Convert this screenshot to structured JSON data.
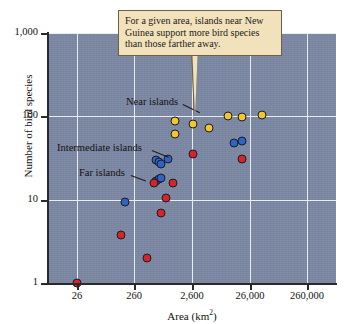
{
  "chart_data": {
    "type": "scatter",
    "title": "",
    "xlabel": "Area (km2)",
    "xlabel_base": "Area (km",
    "xlabel_sup": "2",
    "xlabel_close": ")",
    "ylabel": "Number of bird species",
    "xscale": "log",
    "yscale": "log",
    "xlim": [
      8.2,
      822000
    ],
    "ylim": [
      1,
      1000
    ],
    "grid": true,
    "legend_position": "inline-annotations",
    "xticks": [
      "26",
      "260",
      "2,600",
      "26,000",
      "260,000"
    ],
    "xtick_values": [
      26,
      260,
      2600,
      26000,
      260000
    ],
    "yticks": [
      "1",
      "10",
      "100",
      "1,000"
    ],
    "ytick_values": [
      1,
      10,
      100,
      1000
    ],
    "series": [
      {
        "name": "Near islands",
        "color": "#f2c72e",
        "points": [
          {
            "x": 1300,
            "y": 88
          },
          {
            "x": 1300,
            "y": 62
          },
          {
            "x": 2700,
            "y": 82
          },
          {
            "x": 5200,
            "y": 72
          },
          {
            "x": 11000,
            "y": 102
          },
          {
            "x": 19000,
            "y": 97
          },
          {
            "x": 42000,
            "y": 105
          }
        ]
      },
      {
        "name": "Intermediate islands",
        "color": "#2f63c4",
        "points": [
          {
            "x": 180,
            "y": 9.3
          },
          {
            "x": 620,
            "y": 30
          },
          {
            "x": 700,
            "y": 28
          },
          {
            "x": 760,
            "y": 27
          },
          {
            "x": 1000,
            "y": 31
          },
          {
            "x": 620,
            "y": 17
          },
          {
            "x": 700,
            "y": 17.5
          },
          {
            "x": 760,
            "y": 18
          },
          {
            "x": 14000,
            "y": 48
          },
          {
            "x": 19000,
            "y": 50
          }
        ]
      },
      {
        "name": "Far islands",
        "color": "#d9232b",
        "points": [
          {
            "x": 26,
            "y": 1
          },
          {
            "x": 150,
            "y": 3.8
          },
          {
            "x": 430,
            "y": 2.0
          },
          {
            "x": 560,
            "y": 16
          },
          {
            "x": 760,
            "y": 7.0
          },
          {
            "x": 900,
            "y": 10.5
          },
          {
            "x": 1200,
            "y": 16
          },
          {
            "x": 2700,
            "y": 35
          },
          {
            "x": 19000,
            "y": 31
          }
        ]
      }
    ],
    "annotations": [
      {
        "text": "For a given area, islands near New Guinea support more bird species than those farther away.",
        "type": "callout"
      },
      {
        "text": "Near islands",
        "type": "series-label"
      },
      {
        "text": "Intermediate islands",
        "type": "series-label"
      },
      {
        "text": "Far islands",
        "type": "series-label"
      }
    ]
  },
  "colors": {
    "plot_background": "#7b86a2",
    "gridline": "#e9ecf2",
    "axis": "#2a2a2a",
    "near": "#f2c72e",
    "intermediate": "#2f63c4",
    "far": "#d9232b",
    "callout_fill": "#f2e2bb",
    "callout_border": "#6d6046"
  }
}
